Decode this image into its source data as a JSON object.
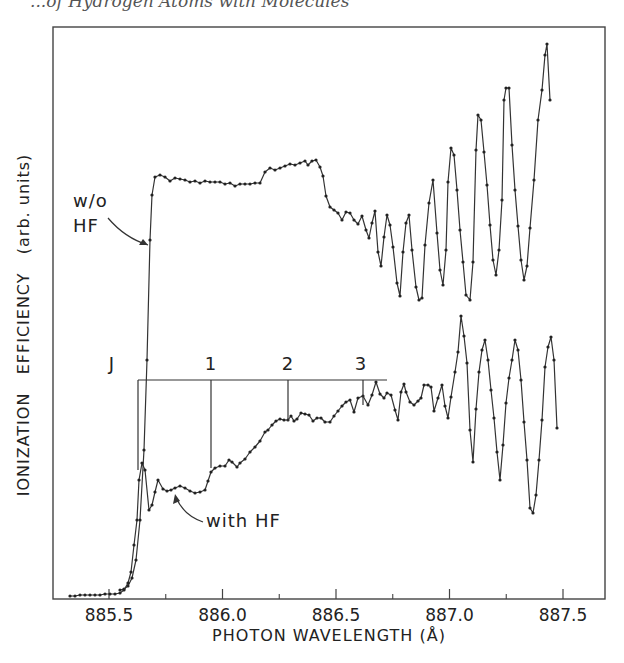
{
  "page": {
    "running_header": "...of Hydrogen Atoms with Molecules"
  },
  "chart_data": {
    "type": "line",
    "title": "",
    "xlabel": "PHOTON WAVELENGTH (Å)",
    "ylabel": "IONIZATION   EFFICIENCY   (arb. units)",
    "xlim": [
      885.3,
      887.65
    ],
    "x_ticks_major": [
      885.5,
      886.0,
      886.5,
      887.0,
      887.5
    ],
    "x_tick_labels": [
      "885.5",
      "886.0",
      "886.5",
      "887.0",
      "887.5"
    ],
    "x_ticks_minor": [
      885.75,
      886.25,
      886.75,
      887.25
    ],
    "y_ticks": [],
    "grid": false,
    "legend": "none (curves labeled by inline annotations)",
    "series": [
      {
        "name": "w/o HF",
        "marker": "dot",
        "line": "solid",
        "points_px": [
          [
            120,
            590
          ],
          [
            124,
            589
          ],
          [
            128,
            586
          ],
          [
            132,
            578
          ],
          [
            136,
            560
          ],
          [
            140,
            520
          ],
          [
            144,
            450
          ],
          [
            147,
            360
          ],
          [
            150,
            240
          ],
          [
            152,
            195
          ],
          [
            155,
            177
          ],
          [
            160,
            175
          ],
          [
            165,
            177
          ],
          [
            170,
            181
          ],
          [
            175,
            178
          ],
          [
            180,
            179
          ],
          [
            185,
            180
          ],
          [
            190,
            182
          ],
          [
            195,
            181
          ],
          [
            200,
            183
          ],
          [
            205,
            181
          ],
          [
            210,
            182
          ],
          [
            215,
            182
          ],
          [
            220,
            182
          ],
          [
            225,
            184
          ],
          [
            230,
            183
          ],
          [
            235,
            186
          ],
          [
            240,
            184
          ],
          [
            245,
            184
          ],
          [
            250,
            184
          ],
          [
            255,
            183
          ],
          [
            260,
            183
          ],
          [
            265,
            172
          ],
          [
            270,
            168
          ],
          [
            275,
            170
          ],
          [
            280,
            168
          ],
          [
            285,
            166
          ],
          [
            290,
            164
          ],
          [
            295,
            165
          ],
          [
            300,
            163
          ],
          [
            305,
            161
          ],
          [
            308,
            165
          ],
          [
            312,
            161
          ],
          [
            316,
            160
          ],
          [
            320,
            167
          ],
          [
            323,
            176
          ],
          [
            326,
            196
          ],
          [
            330,
            207
          ],
          [
            334,
            210
          ],
          [
            338,
            213
          ],
          [
            342,
            220
          ],
          [
            346,
            212
          ],
          [
            350,
            213
          ],
          [
            354,
            220
          ],
          [
            358,
            224
          ],
          [
            362,
            216
          ],
          [
            366,
            230
          ],
          [
            369,
            238
          ],
          [
            372,
            223
          ],
          [
            375,
            211
          ],
          [
            378,
            252
          ],
          [
            381,
            266
          ],
          [
            384,
            237
          ],
          [
            387,
            215
          ],
          [
            390,
            225
          ],
          [
            393,
            247
          ],
          [
            397,
            283
          ],
          [
            400,
            296
          ],
          [
            403,
            252
          ],
          [
            406,
            223
          ],
          [
            409,
            215
          ],
          [
            412,
            250
          ],
          [
            416,
            287
          ],
          [
            419,
            300
          ],
          [
            422,
            298
          ],
          [
            425,
            245
          ],
          [
            429,
            203
          ],
          [
            433,
            180
          ],
          [
            437,
            233
          ],
          [
            440,
            270
          ],
          [
            443,
            285
          ],
          [
            446,
            250
          ],
          [
            448,
            182
          ],
          [
            451,
            148
          ],
          [
            454,
            155
          ],
          [
            457,
            190
          ],
          [
            460,
            230
          ],
          [
            463,
            262
          ],
          [
            466,
            295
          ],
          [
            470,
            300
          ],
          [
            473,
            262
          ],
          [
            476,
            150
          ],
          [
            478,
            115
          ],
          [
            481,
            120
          ],
          [
            484,
            152
          ],
          [
            487,
            185
          ],
          [
            490,
            225
          ],
          [
            493,
            260
          ],
          [
            496,
            275
          ],
          [
            499,
            250
          ],
          [
            502,
            200
          ],
          [
            504,
            100
          ],
          [
            506,
            88
          ],
          [
            509,
            88
          ],
          [
            512,
            145
          ],
          [
            515,
            190
          ],
          [
            518,
            226
          ],
          [
            521,
            260
          ],
          [
            524,
            280
          ],
          [
            527,
            266
          ],
          [
            530,
            228
          ],
          [
            534,
            180
          ],
          [
            538,
            120
          ],
          [
            542,
            90
          ],
          [
            545,
            55
          ],
          [
            547,
            44
          ],
          [
            550,
            100
          ]
        ]
      },
      {
        "name": "with HF",
        "marker": "dot",
        "line": "solid",
        "points_px": [
          [
            70,
            596
          ],
          [
            75,
            596
          ],
          [
            80,
            595
          ],
          [
            85,
            595
          ],
          [
            90,
            595
          ],
          [
            95,
            595
          ],
          [
            100,
            595
          ],
          [
            105,
            594
          ],
          [
            110,
            594
          ],
          [
            115,
            594
          ],
          [
            120,
            593
          ],
          [
            124,
            590
          ],
          [
            128,
            583
          ],
          [
            131,
            572
          ],
          [
            134,
            545
          ],
          [
            137,
            520
          ],
          [
            139,
            480
          ],
          [
            142,
            463
          ],
          [
            145,
            470
          ],
          [
            149,
            510
          ],
          [
            152,
            505
          ],
          [
            155,
            492
          ],
          [
            158,
            480
          ],
          [
            163,
            489
          ],
          [
            167,
            491
          ],
          [
            171,
            490
          ],
          [
            175,
            488
          ],
          [
            180,
            486
          ],
          [
            185,
            488
          ],
          [
            190,
            491
          ],
          [
            195,
            493
          ],
          [
            200,
            492
          ],
          [
            205,
            490
          ],
          [
            208,
            481
          ],
          [
            211,
            472
          ],
          [
            215,
            468
          ],
          [
            220,
            466
          ],
          [
            225,
            466
          ],
          [
            229,
            460
          ],
          [
            232,
            462
          ],
          [
            237,
            467
          ],
          [
            240,
            463
          ],
          [
            245,
            459
          ],
          [
            250,
            452
          ],
          [
            255,
            447
          ],
          [
            260,
            441
          ],
          [
            265,
            432
          ],
          [
            268,
            430
          ],
          [
            272,
            425
          ],
          [
            276,
            421
          ],
          [
            280,
            419
          ],
          [
            284,
            420
          ],
          [
            288,
            420
          ],
          [
            291,
            416
          ],
          [
            294,
            421
          ],
          [
            297,
            419
          ],
          [
            301,
            413
          ],
          [
            305,
            414
          ],
          [
            309,
            415
          ],
          [
            313,
            421
          ],
          [
            317,
            418
          ],
          [
            321,
            418
          ],
          [
            325,
            422
          ],
          [
            330,
            422
          ],
          [
            334,
            416
          ],
          [
            338,
            411
          ],
          [
            342,
            406
          ],
          [
            346,
            402
          ],
          [
            350,
            400
          ],
          [
            354,
            412
          ],
          [
            358,
            398
          ],
          [
            363,
            396
          ],
          [
            368,
            405
          ],
          [
            372,
            395
          ],
          [
            376,
            382
          ],
          [
            380,
            394
          ],
          [
            384,
            398
          ],
          [
            387,
            393
          ],
          [
            391,
            395
          ],
          [
            395,
            410
          ],
          [
            398,
            420
          ],
          [
            401,
            392
          ],
          [
            404,
            384
          ],
          [
            406,
            392
          ],
          [
            410,
            402
          ],
          [
            414,
            405
          ],
          [
            418,
            401
          ],
          [
            421,
            398
          ],
          [
            424,
            385
          ],
          [
            428,
            385
          ],
          [
            431,
            387
          ],
          [
            434,
            411
          ],
          [
            438,
            398
          ],
          [
            442,
            385
          ],
          [
            445,
            406
          ],
          [
            448,
            418
          ],
          [
            451,
            397
          ],
          [
            455,
            372
          ],
          [
            458,
            352
          ],
          [
            461,
            316
          ],
          [
            464,
            336
          ],
          [
            467,
            363
          ],
          [
            470,
            430
          ],
          [
            473,
            462
          ],
          [
            476,
            409
          ],
          [
            479,
            372
          ],
          [
            482,
            350
          ],
          [
            485,
            340
          ],
          [
            488,
            360
          ],
          [
            491,
            390
          ],
          [
            494,
            418
          ],
          [
            497,
            452
          ],
          [
            500,
            480
          ],
          [
            503,
            445
          ],
          [
            506,
            403
          ],
          [
            509,
            378
          ],
          [
            512,
            360
          ],
          [
            515,
            340
          ],
          [
            518,
            350
          ],
          [
            521,
            380
          ],
          [
            524,
            422
          ],
          [
            527,
            460
          ],
          [
            530,
            508
          ],
          [
            533,
            513
          ],
          [
            536,
            495
          ],
          [
            539,
            460
          ],
          [
            542,
            420
          ],
          [
            545,
            367
          ],
          [
            548,
            347
          ],
          [
            551,
            337
          ],
          [
            554,
            360
          ],
          [
            557,
            428
          ]
        ]
      }
    ],
    "annotations": [
      {
        "text": "w/o HF",
        "lines": [
          "w/o",
          "HF"
        ],
        "arrow_to_series": "w/o HF"
      },
      {
        "text": "with HF",
        "arrow_to_series": "with HF"
      },
      {
        "text": "J",
        "type": "progression-label"
      },
      {
        "text": "1",
        "type": "progression-tick",
        "wavelength_approx": 885.95
      },
      {
        "text": "2",
        "type": "progression-tick",
        "wavelength_approx": 886.3
      },
      {
        "text": "3",
        "type": "progression-tick",
        "wavelength_approx": 886.63
      }
    ],
    "progression": {
      "label": "J",
      "ticks": [
        {
          "label": "",
          "wavelength_approx": 885.63
        },
        {
          "label": "1",
          "wavelength_approx": 885.95
        },
        {
          "label": "2",
          "wavelength_approx": 886.3
        },
        {
          "label": "3",
          "wavelength_approx": 886.63
        }
      ]
    }
  }
}
